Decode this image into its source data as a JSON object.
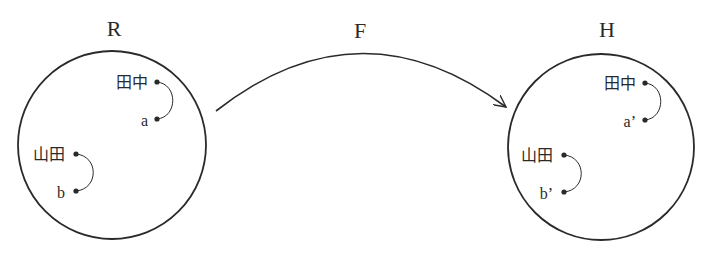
{
  "diagram": {
    "type": "mapping",
    "colors": {
      "stroke": "#2a2a2a",
      "text": "#2a2a2a",
      "background": "#ffffff"
    },
    "mapping_label": "F",
    "source_set": {
      "title": "R",
      "elements": [
        {
          "name": "田中",
          "label": "a"
        },
        {
          "name": "山田",
          "label": "b"
        }
      ]
    },
    "target_set": {
      "title": "H",
      "elements": [
        {
          "name": "田中",
          "label": "a’"
        },
        {
          "name": "山田",
          "label": "b’"
        }
      ]
    }
  }
}
